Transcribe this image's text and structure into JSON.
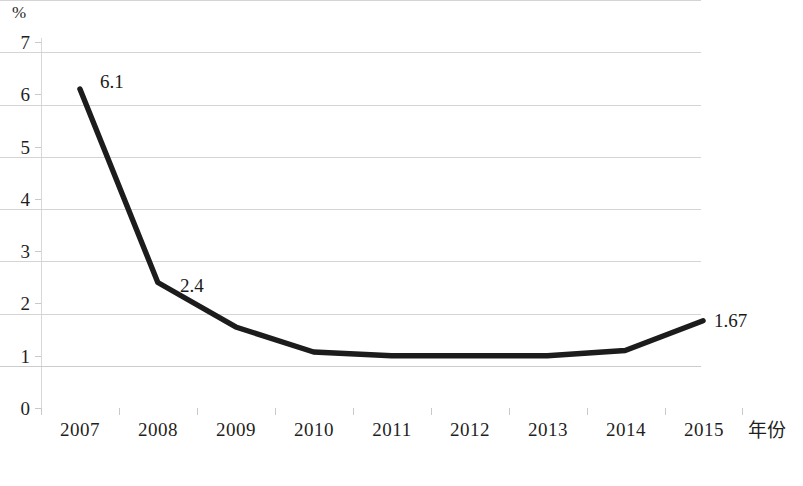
{
  "chart_data": {
    "type": "line",
    "title": "",
    "subtitle": "",
    "xlabel": "年份",
    "ylabel": "",
    "yunit": "%",
    "grid": true,
    "legend": false,
    "legend_position": "none",
    "xlim": [
      "2007",
      "2015"
    ],
    "ylim": [
      0,
      7
    ],
    "ytick_step": 1,
    "categories": [
      "2007",
      "2008",
      "2009",
      "2010",
      "2011",
      "2012",
      "2013",
      "2014",
      "2015"
    ],
    "xticklabels": [
      "2007",
      "2008",
      "2009",
      "2010",
      "2011",
      "2012",
      "2013",
      "2014",
      "2015"
    ],
    "yticklabels": [
      "0",
      "1",
      "2",
      "3",
      "4",
      "5",
      "6",
      "7"
    ],
    "series": [
      {
        "name": "",
        "color": "#1c1c1c",
        "values": [
          6.1,
          2.4,
          1.55,
          1.07,
          1.0,
          1.0,
          1.0,
          1.1,
          1.67
        ]
      }
    ],
    "annotations": [
      {
        "text": "6.1",
        "category": "2007",
        "value": 6.1
      },
      {
        "text": "2.4",
        "category": "2008",
        "value": 2.4
      },
      {
        "text": "1.67",
        "category": "2015",
        "value": 1.67
      }
    ]
  },
  "axis": {
    "y_unit_label": "%",
    "y_labels": [
      "7",
      "6",
      "5",
      "4",
      "3",
      "2",
      "1",
      "0"
    ],
    "x_labels": [
      "2007",
      "2008",
      "2009",
      "2010",
      "2011",
      "2012",
      "2013",
      "2014",
      "2015"
    ],
    "x_title": "年份"
  },
  "labels": {
    "first": "6.1",
    "second": "2.4",
    "last": "1.67"
  },
  "colors": {
    "line": "#1c1c1c",
    "grid": "#d4d4d4",
    "text": "#1f1f1f",
    "background": "#ffffff"
  }
}
